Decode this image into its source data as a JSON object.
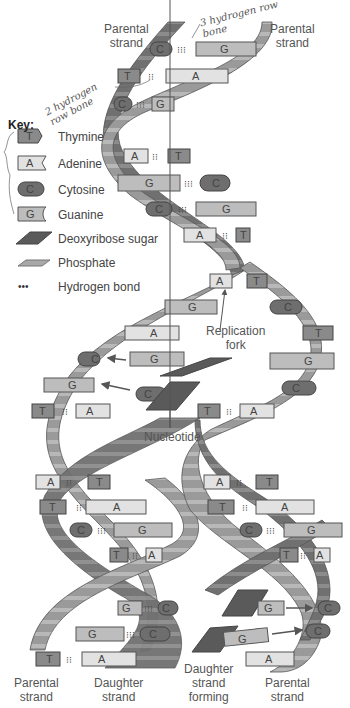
{
  "labels": {
    "top_left": "Parental\nstrand",
    "top_right": "Parental\nstrand",
    "replication_fork": "Replication\nfork",
    "nucleotide": "Nucleotide",
    "bottom_parental_left": "Parental\nstrand",
    "bottom_daughter": "Daughter\nstrand",
    "bottom_daughter_forming": "Daughter\nstrand\nforming",
    "bottom_parental_right": "Parental\nstrand"
  },
  "annotations": {
    "three_h": "3 hydrogen row bone",
    "two_h": "2 hydrogen row bone"
  },
  "key": {
    "title": "Key:",
    "items": [
      {
        "symbol": "T",
        "label": "Thymine",
        "color": "#8a8a8a"
      },
      {
        "symbol": "A",
        "label": "Adenine",
        "color": "#e2e2e2"
      },
      {
        "symbol": "C",
        "label": "Cytosine",
        "color": "#6e6e6e"
      },
      {
        "symbol": "G",
        "label": "Guanine",
        "color": "#bdbdbd"
      },
      {
        "symbol": "",
        "label": "Deoxyribose sugar",
        "color": "#5a5a5a"
      },
      {
        "symbol": "",
        "label": "Phosphate",
        "color": "#a8a8a8"
      },
      {
        "symbol": "...",
        "label": "Hydrogen bond",
        "color": "#333333"
      }
    ]
  },
  "colors": {
    "backbone_light": "#9a9a9a",
    "backbone_dark": "#6a6a6a",
    "stripe": "#c4c4c4"
  },
  "base_pairs_top": [
    [
      "C",
      "G"
    ],
    [
      "T",
      "A"
    ],
    [
      "C",
      "G"
    ],
    [
      "A",
      "T"
    ],
    [
      "G",
      "C"
    ],
    [
      "C",
      "G"
    ],
    [
      "A",
      "T"
    ]
  ],
  "left_daughter_pairs": [
    [
      "T",
      "A"
    ],
    [
      "A",
      "T"
    ],
    [
      "T",
      "A"
    ],
    [
      "C",
      "G"
    ],
    [
      "T",
      "A"
    ],
    [
      "G",
      "C"
    ],
    [
      "G",
      "C"
    ],
    [
      "T",
      "A"
    ]
  ],
  "right_daughter_pairs": [
    [
      "T",
      "A"
    ],
    [
      "A",
      "T"
    ],
    [
      "T",
      "A"
    ],
    [
      "C",
      "G"
    ],
    [
      "T",
      "A"
    ],
    [
      "G",
      "C"
    ],
    [
      "G",
      "C"
    ],
    [
      "A",
      ""
    ]
  ]
}
